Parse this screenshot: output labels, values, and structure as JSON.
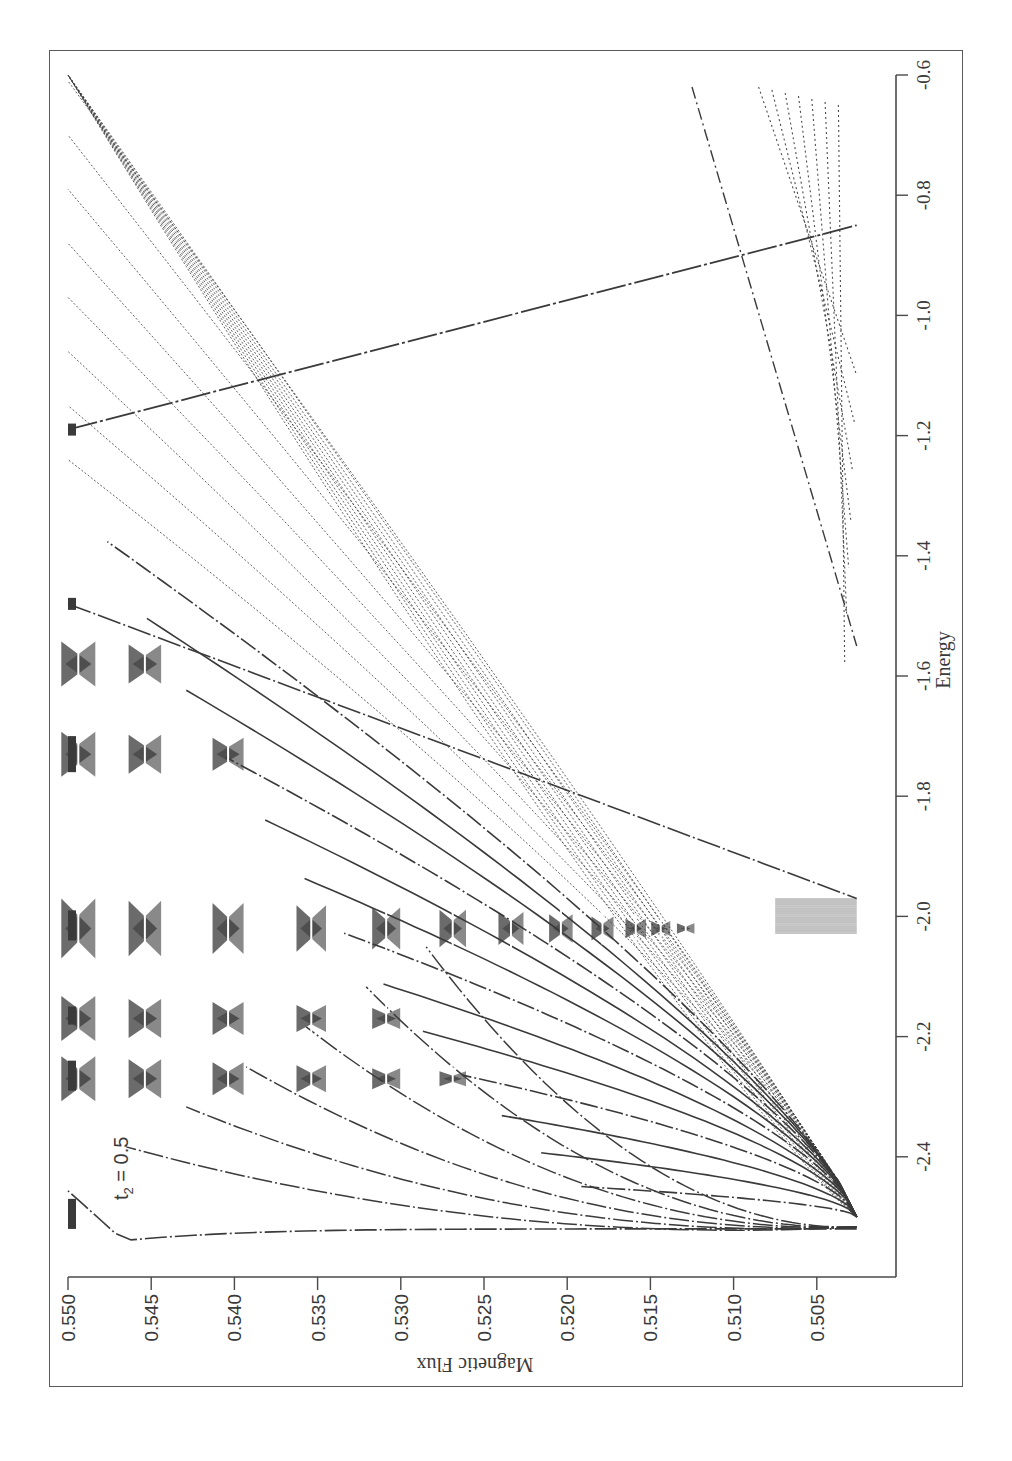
{
  "figure": {
    "rotation_deg": -90,
    "colors": {
      "ink": "#3a3a3a",
      "frame": "#5a5a5a",
      "background": "#ffffff"
    },
    "annotation": {
      "text_main": "t",
      "text_sub": "2",
      "text_rest": " = 0.5"
    }
  },
  "chart_data": {
    "type": "scatter",
    "title": "",
    "xlabel": "Magnetic Flux",
    "ylabel": "Energy",
    "annotation": "t2 = 0.5",
    "xlim": [
      0.5003,
      0.55
    ],
    "ylim": [
      -2.6,
      -0.6
    ],
    "x_ticks": [
      "0.550",
      "0.545",
      "0.540",
      "0.535",
      "0.530",
      "0.525",
      "0.520",
      "0.515",
      "0.510",
      "0.505"
    ],
    "x_tick_values": [
      0.55,
      0.545,
      0.54,
      0.535,
      0.53,
      0.525,
      0.52,
      0.515,
      0.51,
      0.505
    ],
    "y_ticks": [
      "-2.4",
      "-2.2",
      "-2.0",
      "-1.8",
      "-1.6",
      "-1.4",
      "-1.2",
      "-1.0",
      "-0.8",
      "-0.6"
    ],
    "y_tick_values": [
      -2.4,
      -2.2,
      -2.0,
      -1.8,
      -1.6,
      -1.4,
      -1.2,
      -1.0,
      -0.8,
      -0.6
    ],
    "grid": false,
    "legend": null,
    "orientation": "rotated 90 degrees (flux axis horizontal at bottom, decreasing left-to-right; energy axis vertical on right, increasing upward)",
    "features": {
      "band_bottom_energy": -2.5,
      "band_bottom_flux": 0.5026,
      "dense_center_energy": -2.0,
      "fan_count_lower": 30,
      "fan_count_upper": 22,
      "butterfly_cluster_energies": [
        -2.27,
        -2.17,
        -2.02,
        -1.73,
        -1.58
      ],
      "crossing_line": {
        "from": {
          "flux": 0.55,
          "energy": -1.48
        },
        "to": {
          "flux": 0.5026,
          "energy": -1.97
        }
      },
      "lone_line": {
        "from": {
          "flux": 0.55,
          "energy": -1.19
        },
        "to": {
          "flux": 0.5026,
          "energy": -0.85
        }
      },
      "dash_dot_line": {
        "from": {
          "flux": 0.5125,
          "energy": -0.62
        },
        "to": {
          "flux": 0.5026,
          "energy": -1.55
        }
      }
    }
  }
}
